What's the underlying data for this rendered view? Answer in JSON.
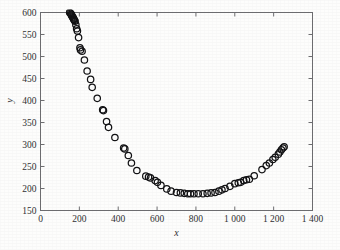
{
  "figure": {
    "background_color": "#fdfdfc",
    "axis_color": "#6d6d70",
    "marker_color": "#121214",
    "text_color": "#2f2f31"
  },
  "chart_data": {
    "type": "scatter",
    "title": "",
    "subtitle": "",
    "xlabel": "x",
    "ylabel": "y",
    "xlim": [
      0,
      1400
    ],
    "ylim": [
      150,
      600
    ],
    "xticks": [
      0,
      200,
      400,
      600,
      800,
      1000,
      1200,
      1400
    ],
    "xticklabels": [
      "0",
      "200",
      "400",
      "600",
      "800",
      "1 000",
      "1 200",
      "1 400"
    ],
    "yticks": [
      150,
      200,
      250,
      300,
      350,
      400,
      450,
      500,
      550,
      600
    ],
    "yticklabels": [
      "150",
      "200",
      "250",
      "300",
      "350",
      "400",
      "450",
      "500",
      "550",
      "600"
    ],
    "grid": false,
    "legend": null,
    "marker_style": "open-circle",
    "marker_size": 4.6,
    "annotations": [],
    "series": [
      {
        "name": "observations",
        "points": [
          [
            150,
            600
          ],
          [
            155,
            598
          ],
          [
            158,
            596
          ],
          [
            160,
            594
          ],
          [
            162,
            592
          ],
          [
            165,
            590
          ],
          [
            168,
            588
          ],
          [
            170,
            586
          ],
          [
            172,
            584
          ],
          [
            175,
            582
          ],
          [
            178,
            580
          ],
          [
            182,
            572
          ],
          [
            186,
            563
          ],
          [
            190,
            558
          ],
          [
            196,
            543
          ],
          [
            203,
            520
          ],
          [
            206,
            515
          ],
          [
            214,
            512
          ],
          [
            226,
            492
          ],
          [
            240,
            467
          ],
          [
            258,
            448
          ],
          [
            266,
            430
          ],
          [
            292,
            405
          ],
          [
            320,
            379
          ],
          [
            324,
            377
          ],
          [
            340,
            352
          ],
          [
            350,
            339
          ],
          [
            383,
            316
          ],
          [
            428,
            292
          ],
          [
            434,
            290
          ],
          [
            452,
            275
          ],
          [
            468,
            258
          ],
          [
            496,
            241
          ],
          [
            542,
            228
          ],
          [
            556,
            226
          ],
          [
            566,
            224
          ],
          [
            590,
            218
          ],
          [
            602,
            214
          ],
          [
            620,
            207
          ],
          [
            650,
            199
          ],
          [
            672,
            194
          ],
          [
            700,
            191
          ],
          [
            720,
            190
          ],
          [
            740,
            189
          ],
          [
            758,
            188
          ],
          [
            772,
            188
          ],
          [
            790,
            188
          ],
          [
            812,
            188
          ],
          [
            836,
            188
          ],
          [
            858,
            189
          ],
          [
            878,
            190
          ],
          [
            898,
            191
          ],
          [
            918,
            194
          ],
          [
            934,
            197
          ],
          [
            950,
            200
          ],
          [
            975,
            205
          ],
          [
            1000,
            211
          ],
          [
            1018,
            213
          ],
          [
            1030,
            214
          ],
          [
            1046,
            218
          ],
          [
            1060,
            220
          ],
          [
            1075,
            221
          ],
          [
            1100,
            229
          ],
          [
            1140,
            243
          ],
          [
            1162,
            252
          ],
          [
            1178,
            258
          ],
          [
            1196,
            266
          ],
          [
            1208,
            271
          ],
          [
            1224,
            278
          ],
          [
            1232,
            283
          ],
          [
            1240,
            288
          ],
          [
            1248,
            292
          ],
          [
            1254,
            295
          ]
        ]
      }
    ]
  }
}
